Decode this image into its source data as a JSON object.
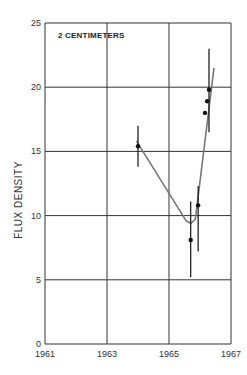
{
  "chart_data": {
    "type": "scatter",
    "title": "2 CENTIMETERS",
    "xlabel": "",
    "ylabel": "FLUX DENSITY",
    "xlim": [
      1961,
      1967
    ],
    "ylim": [
      0,
      25
    ],
    "x_ticks": [
      "1961",
      "1963",
      "1965",
      "1967"
    ],
    "y_ticks": [
      "0",
      "5",
      "10",
      "15",
      "20",
      "25"
    ],
    "grid": true,
    "legend": null,
    "series": [
      {
        "name": "observations",
        "points": [
          {
            "x": 1964.0,
            "y": 15.4,
            "y_err_low": 13.8,
            "y_err_high": 17.0
          },
          {
            "x": 1965.7,
            "y": 8.1,
            "y_err_low": 5.2,
            "y_err_high": 11.1
          },
          {
            "x": 1965.94,
            "y": 10.8,
            "y_err_low": 7.2,
            "y_err_high": 12.3
          },
          {
            "x": 1966.16,
            "y": 18.0
          },
          {
            "x": 1966.23,
            "y": 18.9
          },
          {
            "x": 1966.29,
            "y": 19.8,
            "y_err_low": 16.5,
            "y_err_high": 23.0
          }
        ]
      },
      {
        "name": "trend curve",
        "style": "line",
        "x": [
          1963.95,
          1965.55,
          1965.7,
          1965.85,
          1966.45
        ],
        "y": [
          15.8,
          9.6,
          9.4,
          9.7,
          21.5
        ]
      }
    ]
  },
  "labels": {
    "title": "2 CENTIMETERS",
    "ylabel": "FLUX DENSITY"
  }
}
